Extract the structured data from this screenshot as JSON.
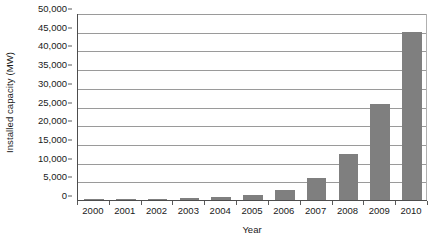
{
  "chart_data": {
    "type": "bar",
    "title": "",
    "xlabel": "Year",
    "ylabel": "Installed capacity (MW)",
    "categories": [
      "2000",
      "2001",
      "2002",
      "2003",
      "2004",
      "2005",
      "2006",
      "2007",
      "2008",
      "2009",
      "2010"
    ],
    "values": [
      170,
      280,
      350,
      450,
      700,
      1300,
      2800,
      5900,
      12300,
      25800,
      44800
    ],
    "ylim": [
      0,
      50000
    ],
    "y_ticks": [
      0,
      5000,
      10000,
      15000,
      20000,
      25000,
      30000,
      35000,
      40000,
      45000,
      50000
    ],
    "y_tick_labels": [
      "0",
      "5,000",
      "10,000",
      "15,000",
      "20,000",
      "25,000",
      "30,000",
      "35,000",
      "40,000",
      "45,000",
      "50,000"
    ],
    "grid": true,
    "legend": false,
    "legend_position": "none",
    "series": [
      {
        "name": "Installed capacity",
        "color": "#7f7f7f",
        "values": [
          170,
          280,
          350,
          450,
          700,
          1300,
          2800,
          5900,
          12300,
          25800,
          44800
        ]
      }
    ]
  },
  "axes": {
    "y_title": "Installed capacity (MW)",
    "x_title": "Year"
  },
  "colors": {
    "bar": "#7f7f7f",
    "gridline": "#9a9a9a",
    "axis": "#4d4d4d",
    "background": "#ffffff",
    "text": "#1a1a1a"
  }
}
